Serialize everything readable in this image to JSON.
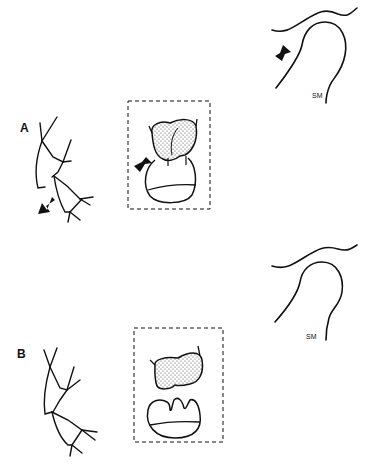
{
  "panels": [
    {
      "id": "A",
      "label": "A",
      "joint_label": "SM",
      "arrows": true,
      "state": "displaced"
    },
    {
      "id": "B",
      "label": "B",
      "joint_label": "SM",
      "arrows": false,
      "state": "reduced"
    }
  ],
  "colors": {
    "ink": "#111111",
    "background": "#ffffff",
    "stipple": "#555555"
  }
}
